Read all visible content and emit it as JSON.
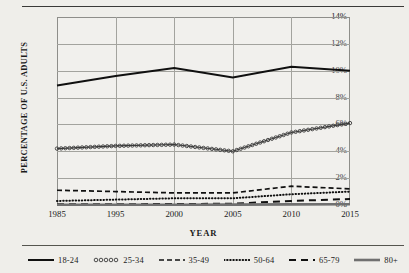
{
  "chart_data": {
    "type": "line",
    "title": "",
    "xlabel": "YEAR",
    "ylabel": "PERCENTAGE OF U.S. ADULTS",
    "x": [
      1985,
      1995,
      2000,
      2005,
      2010,
      2015
    ],
    "xtick_labels": [
      "1985",
      "1995",
      "2000",
      "2005",
      "2010",
      "2015"
    ],
    "ytick_labels": [
      "0%",
      "2%",
      "4%",
      "6%",
      "8%",
      "10%",
      "12%",
      "14%"
    ],
    "ytick_values": [
      0,
      2,
      4,
      6,
      8,
      10,
      12,
      14
    ],
    "ylim": [
      0,
      14
    ],
    "grid": true,
    "legend_position": "bottom",
    "series": [
      {
        "name": "18-24",
        "style": "solid",
        "color": "#101010",
        "values": [
          8.9,
          9.6,
          10.2,
          9.5,
          10.3,
          10.0
        ]
      },
      {
        "name": "25-34",
        "style": "circles",
        "color": "#3a3a3a",
        "values": [
          4.2,
          4.4,
          4.5,
          4.0,
          5.4,
          6.1
        ]
      },
      {
        "name": "35-49",
        "style": "dashed",
        "color": "#101010",
        "values": [
          1.1,
          1.0,
          0.9,
          0.9,
          1.4,
          1.2
        ]
      },
      {
        "name": "50-64",
        "style": "dotted",
        "color": "#101010",
        "values": [
          0.3,
          0.4,
          0.5,
          0.5,
          0.8,
          1.0
        ]
      },
      {
        "name": "65-79",
        "style": "long-dash",
        "color": "#101010",
        "values": [
          0.05,
          0.06,
          0.07,
          0.1,
          0.3,
          0.45
        ]
      },
      {
        "name": "80+",
        "style": "thick-solid",
        "color": "#707070",
        "values": [
          0.02,
          0.02,
          0.02,
          0.03,
          0.05,
          0.06
        ]
      }
    ]
  }
}
